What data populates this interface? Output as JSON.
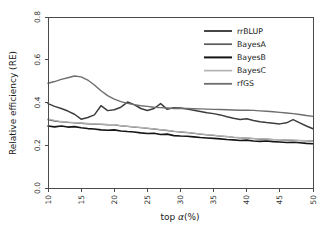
{
  "chart_data": {
    "type": "line",
    "title": "",
    "xlabel": "top α(%)",
    "ylabel": "Relative efficiency (RE)",
    "xlim": [
      10,
      50
    ],
    "ylim": [
      0.0,
      0.8
    ],
    "xticks": [
      10,
      15,
      20,
      25,
      30,
      35,
      40,
      45,
      50
    ],
    "xticklabels": [
      "10",
      "15",
      "20",
      "25",
      "30",
      "35",
      "40",
      "45",
      "50"
    ],
    "yticks": [
      0.0,
      0.2,
      0.4,
      0.6,
      0.8
    ],
    "yticklabels": [
      "0.0",
      "0.2",
      "0.4",
      "0.6",
      "0.8"
    ],
    "grid": false,
    "legend_position": "top-right",
    "x": [
      10,
      11,
      12,
      13,
      14,
      15,
      16,
      17,
      18,
      19,
      20,
      21,
      22,
      23,
      24,
      25,
      26,
      27,
      28,
      29,
      30,
      31,
      32,
      33,
      34,
      35,
      36,
      37,
      38,
      39,
      40,
      41,
      42,
      43,
      44,
      45,
      46,
      47,
      48,
      49,
      50
    ],
    "series": [
      {
        "name": "rrBLUP",
        "color": "#3d3d3d",
        "width": 1.5,
        "values": [
          0.395,
          0.382,
          0.372,
          0.36,
          0.345,
          0.322,
          0.33,
          0.342,
          0.385,
          0.362,
          0.366,
          0.378,
          0.402,
          0.39,
          0.372,
          0.363,
          0.372,
          0.395,
          0.368,
          0.376,
          0.374,
          0.369,
          0.364,
          0.358,
          0.352,
          0.348,
          0.342,
          0.333,
          0.326,
          0.32,
          0.324,
          0.316,
          0.31,
          0.306,
          0.303,
          0.3,
          0.305,
          0.32,
          0.305,
          0.29,
          0.277
        ]
      },
      {
        "name": "BayesA",
        "color": "#5a5a5a",
        "width": 1.3,
        "values": [
          0.32,
          0.313,
          0.309,
          0.307,
          0.305,
          0.303,
          0.3,
          0.299,
          0.298,
          0.296,
          0.295,
          0.291,
          0.288,
          0.285,
          0.282,
          0.279,
          0.276,
          0.272,
          0.269,
          0.265,
          0.262,
          0.259,
          0.256,
          0.252,
          0.249,
          0.246,
          0.243,
          0.24,
          0.237,
          0.235,
          0.233,
          0.231,
          0.229,
          0.228,
          0.226,
          0.225,
          0.224,
          0.223,
          0.222,
          0.221,
          0.22
        ]
      },
      {
        "name": "BayesB",
        "color": "#151515",
        "width": 1.6,
        "values": [
          0.29,
          0.286,
          0.29,
          0.285,
          0.287,
          0.282,
          0.278,
          0.276,
          0.272,
          0.27,
          0.272,
          0.267,
          0.264,
          0.262,
          0.258,
          0.255,
          0.256,
          0.25,
          0.252,
          0.245,
          0.243,
          0.242,
          0.239,
          0.236,
          0.234,
          0.232,
          0.23,
          0.227,
          0.225,
          0.222,
          0.224,
          0.22,
          0.218,
          0.22,
          0.217,
          0.215,
          0.213,
          0.214,
          0.212,
          0.209,
          0.207
        ]
      },
      {
        "name": "BayesC",
        "color": "#b4b4b4",
        "width": 1.3,
        "values": [
          0.323,
          0.316,
          0.311,
          0.308,
          0.306,
          0.304,
          0.302,
          0.3,
          0.299,
          0.297,
          0.296,
          0.292,
          0.289,
          0.286,
          0.283,
          0.28,
          0.277,
          0.273,
          0.27,
          0.266,
          0.263,
          0.26,
          0.257,
          0.253,
          0.25,
          0.247,
          0.244,
          0.241,
          0.238,
          0.236,
          0.234,
          0.232,
          0.23,
          0.229,
          0.227,
          0.226,
          0.225,
          0.224,
          0.223,
          0.222,
          0.219
        ]
      },
      {
        "name": "rfGS",
        "color": "#6e6e6e",
        "width": 1.4,
        "values": [
          0.49,
          0.498,
          0.508,
          0.516,
          0.524,
          0.52,
          0.505,
          0.482,
          0.455,
          0.432,
          0.416,
          0.404,
          0.396,
          0.39,
          0.385,
          0.382,
          0.378,
          0.376,
          0.374,
          0.372,
          0.373,
          0.372,
          0.371,
          0.37,
          0.369,
          0.368,
          0.367,
          0.366,
          0.365,
          0.364,
          0.364,
          0.363,
          0.361,
          0.359,
          0.357,
          0.354,
          0.351,
          0.348,
          0.344,
          0.339,
          0.335
        ]
      }
    ]
  },
  "legend": {
    "entries": [
      {
        "label": "rrBLUP"
      },
      {
        "label": "BayesA"
      },
      {
        "label": "BayesB"
      },
      {
        "label": "BayesC"
      },
      {
        "label": "rfGS"
      }
    ]
  },
  "axes": {
    "y_title": "Relative efficiency (RE)",
    "x_title_prefix": "top ",
    "x_title_symbol": "α",
    "x_title_suffix": "(%)"
  }
}
